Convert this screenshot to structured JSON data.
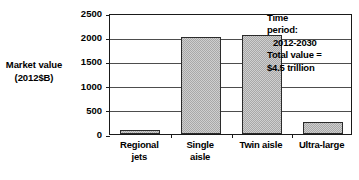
{
  "chart_data": {
    "type": "bar",
    "title": "",
    "xlabel": "",
    "ylabel": "Market value (2012$B)",
    "categories": [
      "Regional jets",
      "Single aisle",
      "Twin aisle",
      "Ultra-large"
    ],
    "values": [
      90,
      2010,
      2050,
      250
    ],
    "ylim": [
      0,
      2500
    ],
    "ytick_values": [
      0,
      500,
      1000,
      1500,
      2000,
      2500
    ],
    "ytick_labels": [
      "0",
      "500",
      "1000",
      "1500",
      "2000",
      "2500"
    ],
    "grid": true,
    "legend": false,
    "bar_color": "#a8a8a8",
    "bar_edge_color": "#2b2b2b",
    "axis_color": "#1a1a1a",
    "gridline_color": "#4d4d4d",
    "background_color": "#ffffff"
  },
  "y_axis": {
    "title_lines": [
      "Market value",
      "(2012$B)"
    ],
    "ticks": [
      {
        "label": "2500",
        "value": 2500
      },
      {
        "label": "2000",
        "value": 2000
      },
      {
        "label": "1500",
        "value": 1500
      },
      {
        "label": "1000",
        "value": 1000
      },
      {
        "label": "500",
        "value": 500
      },
      {
        "label": "0",
        "value": 0
      }
    ]
  },
  "x_axis": {
    "categories": [
      {
        "lines": [
          "Regional",
          "jets"
        ]
      },
      {
        "lines": [
          "Single",
          "aisle"
        ]
      },
      {
        "lines": [
          "Twin aisle"
        ]
      },
      {
        "lines": [
          "Ultra-large"
        ]
      }
    ]
  },
  "annotation": {
    "lines": [
      "Time",
      "period:",
      "2012-2030",
      "Total value =",
      "$4.5 trillion"
    ],
    "indent_flags": [
      false,
      false,
      true,
      false,
      false
    ]
  }
}
